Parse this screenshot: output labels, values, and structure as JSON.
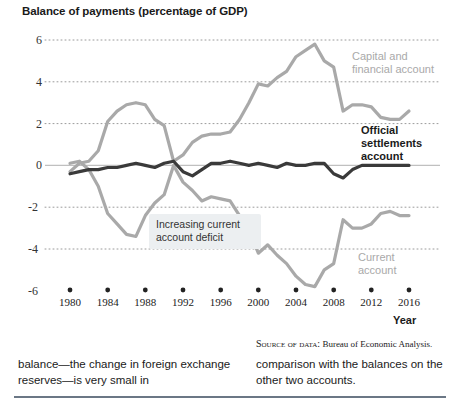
{
  "chart_data": {
    "type": "line",
    "title": "Balance of payments (percentage of GDP)",
    "xlabel": "Year",
    "ylabel": "",
    "xlim": [
      1980,
      2016
    ],
    "ylim": [
      -6,
      6
    ],
    "grid": true,
    "legend_position": "inline-right",
    "xticks": [
      1980,
      1984,
      1988,
      1992,
      1996,
      2000,
      2004,
      2008,
      2012,
      2016
    ],
    "yticks": [
      6,
      4,
      2,
      0,
      -2,
      -4,
      -6
    ],
    "x": [
      1980,
      1981,
      1982,
      1983,
      1984,
      1985,
      1986,
      1987,
      1988,
      1989,
      1990,
      1991,
      1992,
      1993,
      1994,
      1995,
      1996,
      1997,
      1998,
      1999,
      2000,
      2001,
      2002,
      2003,
      2004,
      2005,
      2006,
      2007,
      2008,
      2009,
      2010,
      2011,
      2012,
      2013,
      2014,
      2015,
      2016
    ],
    "series": [
      {
        "name": "Capital and financial account",
        "color": "#a9a9a9",
        "values": [
          -0.3,
          0.1,
          0.2,
          0.7,
          2.1,
          2.6,
          2.9,
          3.0,
          2.9,
          2.2,
          1.9,
          0.2,
          0.5,
          1.1,
          1.4,
          1.5,
          1.5,
          1.6,
          2.2,
          3.0,
          3.9,
          3.8,
          4.2,
          4.5,
          5.2,
          5.5,
          5.8,
          5.0,
          4.7,
          2.6,
          2.9,
          2.9,
          2.8,
          2.3,
          2.2,
          2.2,
          2.6
        ]
      },
      {
        "name": "Official settlements account",
        "color": "#3a3a3a",
        "values": [
          -0.4,
          -0.3,
          -0.2,
          -0.2,
          -0.1,
          -0.1,
          0.0,
          0.1,
          0.0,
          -0.1,
          0.1,
          0.2,
          -0.3,
          -0.5,
          -0.2,
          0.1,
          0.1,
          0.2,
          0.1,
          0.0,
          0.1,
          0.0,
          -0.1,
          0.1,
          0.0,
          0.0,
          0.1,
          0.1,
          -0.4,
          -0.6,
          -0.2,
          0.0,
          0.0,
          0.0,
          0.0,
          0.0,
          0.0
        ]
      },
      {
        "name": "Current account",
        "color": "#a9a9a9",
        "values": [
          0.1,
          0.2,
          -0.2,
          -1.0,
          -2.3,
          -2.8,
          -3.3,
          -3.4,
          -2.4,
          -1.8,
          -1.4,
          0.0,
          -0.8,
          -1.2,
          -1.7,
          -1.5,
          -1.6,
          -1.7,
          -2.4,
          -3.1,
          -4.2,
          -3.8,
          -4.3,
          -4.7,
          -5.3,
          -5.7,
          -5.8,
          -5.0,
          -4.7,
          -2.6,
          -3.0,
          -3.0,
          -2.8,
          -2.3,
          -2.2,
          -2.4,
          -2.4
        ]
      }
    ],
    "annotations": [
      {
        "id": "increasing-deficit",
        "text": "Increasing current account deficit",
        "points_to_series": "Current account"
      }
    ],
    "series_labels": [
      {
        "id": "capital-label",
        "line1": "Capital and",
        "line2": "financial account",
        "emphasis": "normal"
      },
      {
        "id": "official-label",
        "line1": "Official",
        "line2": "settlements",
        "line3": "account",
        "emphasis": "bold"
      },
      {
        "id": "current-label",
        "line1": "Current",
        "line2": "account",
        "emphasis": "normal"
      }
    ]
  },
  "footer": {
    "source_prefix": "Source of data:",
    "source_text": "Bureau of Economic Analysis.",
    "left_column": "balance—the change in foreign exchange reserves—is very small in",
    "right_column": "comparison with the balances on the other two accounts."
  }
}
